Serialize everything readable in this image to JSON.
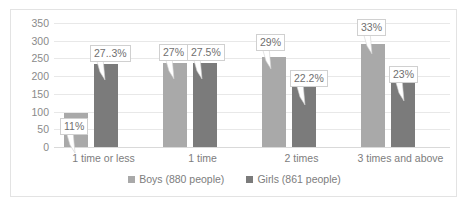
{
  "chart_data": {
    "type": "bar",
    "title": "",
    "subtitle": "",
    "xlabel": "",
    "ylabel": "",
    "ylim": [
      0,
      350
    ],
    "ytick_step": 50,
    "yticks": [
      350,
      300,
      250,
      200,
      150,
      100,
      50,
      0
    ],
    "grid": true,
    "legend_position": "bottom",
    "categories": [
      "1 time or less",
      "1 time",
      "2 times",
      "3 times and above"
    ],
    "series": [
      {
        "name": "Boys (880 people)",
        "color": "#a9a9a9",
        "values": [
          95,
          237,
          255,
          290
        ],
        "labels": [
          "11%",
          "27%",
          "29%",
          "33%"
        ]
      },
      {
        "name": "Girls (861 people)",
        "color": "#7b7b7b",
        "values": [
          235,
          237,
          191,
          198
        ],
        "labels": [
          "27..3%",
          "27.5%",
          "22.2%",
          "23%"
        ]
      }
    ]
  },
  "legend": {
    "items": [
      {
        "label": "Boys (880 people)",
        "marker": "square-marker"
      },
      {
        "label": "Girls (861 people)",
        "marker": "square-marker"
      }
    ]
  }
}
